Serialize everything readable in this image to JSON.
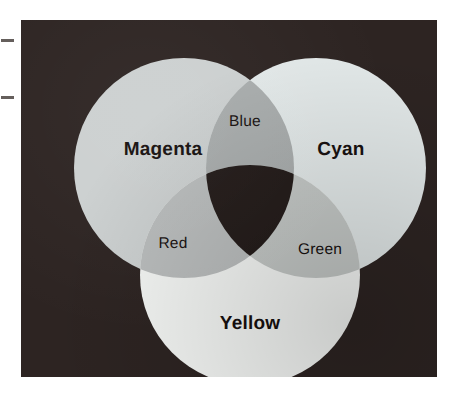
{
  "figure": {
    "kind": "venn-diagram",
    "topic": "Subtractive color mixing (CMY)",
    "background_color": "#ffffff",
    "panel_color": "#2d2422"
  },
  "chart_data": {
    "type": "venn",
    "title": "",
    "subtitle": "",
    "xlabel": "",
    "ylabel": "",
    "grid": false,
    "legend": "none",
    "sets": [
      {
        "id": "magenta",
        "label": "Magenta",
        "emphasis": "primary",
        "fill": "#ccd0d0",
        "center": [
          163,
          148
        ],
        "radius": 110
      },
      {
        "id": "cyan",
        "label": "Cyan",
        "emphasis": "primary",
        "fill": "#e2e8e8",
        "center": [
          295,
          148
        ],
        "radius": 110
      },
      {
        "id": "yellow",
        "label": "Yellow",
        "emphasis": "primary",
        "fill": "#f5f7f5",
        "center": [
          229,
          255
        ],
        "radius": 110
      }
    ],
    "intersections": [
      {
        "id": "blue",
        "label": "Blue",
        "emphasis": "secondary",
        "members": [
          "magenta",
          "cyan"
        ],
        "fill": "#a9adad",
        "center": [
          224,
          102
        ]
      },
      {
        "id": "red",
        "label": "Red",
        "emphasis": "secondary",
        "members": [
          "magenta",
          "yellow"
        ],
        "fill": "#babdbd",
        "center": [
          152,
          224
        ]
      },
      {
        "id": "green",
        "label": "Green",
        "emphasis": "secondary",
        "members": [
          "cyan",
          "yellow"
        ],
        "fill": "#c4c8c6",
        "center": [
          299,
          230
        ]
      },
      {
        "id": "black",
        "label": "",
        "emphasis": "none",
        "members": [
          "magenta",
          "cyan",
          "yellow"
        ],
        "fill": "#231b19",
        "center": [
          229,
          185
        ]
      }
    ],
    "label_color": "#17100f"
  },
  "annotations": {
    "margin_marks": [
      {
        "name": "margin-dash-upper",
        "y": 39
      },
      {
        "name": "margin-dash-lower",
        "y": 96
      }
    ]
  }
}
